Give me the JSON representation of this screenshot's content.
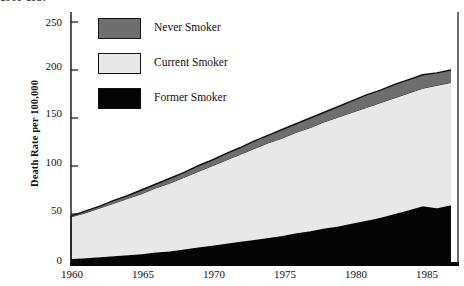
{
  "chart_data": {
    "type": "area",
    "stacked": true,
    "title": "1960-1987",
    "title_clipped": true,
    "xlabel": "",
    "ylabel": "Death Rate per 100,000",
    "xlim": [
      1960,
      1987.5
    ],
    "ylim": [
      0,
      250
    ],
    "grid": false,
    "legend_position": "upper-left-inside",
    "xticks": [
      1960,
      1965,
      1970,
      1975,
      1980,
      1985
    ],
    "yticks": [
      0,
      50,
      100,
      150,
      200,
      250
    ],
    "x": [
      1960,
      1961,
      1962,
      1963,
      1964,
      1965,
      1966,
      1967,
      1968,
      1969,
      1970,
      1971,
      1972,
      1973,
      1974,
      1975,
      1976,
      1977,
      1978,
      1979,
      1980,
      1981,
      1982,
      1983,
      1984,
      1985,
      1986,
      1987
    ],
    "series": [
      {
        "name": "Former Smoker",
        "color": "#050505",
        "values": [
          3,
          4,
          5,
          6,
          7,
          8,
          10,
          11,
          13,
          15,
          17,
          19,
          21,
          23,
          25,
          27,
          30,
          32,
          35,
          37,
          40,
          43,
          46,
          50,
          54,
          58,
          56,
          59
        ]
      },
      {
        "name": "Current Smoker",
        "color": "#e8e8e8",
        "values": [
          44,
          47,
          51,
          55,
          59,
          63,
          67,
          71,
          75,
          79,
          83,
          87,
          91,
          95,
          99,
          102,
          105,
          108,
          111,
          114,
          116,
          118,
          120,
          121,
          122,
          123,
          128,
          128
        ]
      },
      {
        "name": "Never Smoker",
        "color": "#6e6e6e",
        "values": [
          1,
          2,
          2,
          3,
          3,
          4,
          4,
          5,
          5,
          6,
          6,
          7,
          7,
          8,
          8,
          9,
          9,
          10,
          10,
          11,
          12,
          13,
          13,
          14,
          14,
          14,
          13,
          13
        ]
      }
    ],
    "totals": [
      48,
      53,
      58,
      64,
      69,
      75,
      81,
      87,
      93,
      100,
      106,
      113,
      119,
      126,
      132,
      138,
      144,
      150,
      156,
      162,
      168,
      174,
      179,
      185,
      190,
      195,
      197,
      200
    ],
    "legend": [
      {
        "label": "Never Smoker",
        "color": "#6e6e6e"
      },
      {
        "label": "Current Smoker",
        "color": "#e8e8e8"
      },
      {
        "label": "Former Smoker",
        "color": "#050505"
      }
    ]
  }
}
